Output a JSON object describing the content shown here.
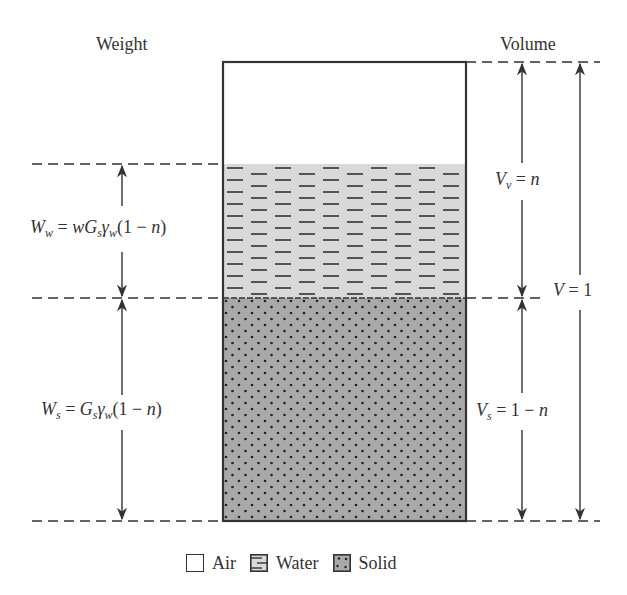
{
  "headers": {
    "weight": "Weight",
    "volume": "Volume"
  },
  "phases": [
    {
      "name": "Air",
      "fill": "#ffffff",
      "top": 62,
      "bottom": 164
    },
    {
      "name": "Water",
      "fill": "#d9d9d9",
      "top": 164,
      "bottom": 298
    },
    {
      "name": "Solid",
      "fill": "#a9a9a9",
      "top": 298,
      "bottom": 521
    }
  ],
  "labels": {
    "Ww": {
      "sym": "W",
      "sub": "w",
      "rhs_pre": "= ",
      "rhs_w": "w",
      "rhs_G": "G",
      "rhs_Gsub": "s",
      "rhs_gamma": "γ",
      "rhs_gsub": "w",
      "rhs_tail": "(1 − ",
      "rhs_n": "n",
      "rhs_close": ")"
    },
    "Ws": {
      "sym": "W",
      "sub": "s",
      "rhs_pre": "= ",
      "rhs_G": "G",
      "rhs_Gsub": "s",
      "rhs_gamma": "γ",
      "rhs_gsub": "w",
      "rhs_tail": "(1 − ",
      "rhs_n": "n",
      "rhs_close": ")"
    },
    "Vv": {
      "sym": "V",
      "sub": "v",
      "rhs_pre": " = ",
      "rhs_n": "n"
    },
    "Vs": {
      "sym": "V",
      "sub": "s",
      "rhs_pre": " = 1 − ",
      "rhs_n": "n"
    },
    "V": {
      "sym": "V",
      "rhs_pre": " = 1"
    }
  },
  "legend": [
    {
      "label": "Air",
      "icon": "air-swatch-icon"
    },
    {
      "label": "Water",
      "icon": "water-swatch-icon"
    },
    {
      "label": "Solid",
      "icon": "solid-swatch-icon"
    }
  ],
  "colors": {
    "line": "#333333",
    "water_fill": "#d9d9d9",
    "solid_fill": "#a9a9a9",
    "dash": "#333333"
  }
}
